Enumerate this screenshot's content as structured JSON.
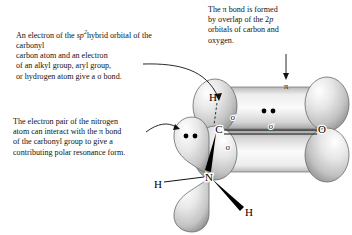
{
  "figure": {
    "title_semantic": "orbital-picture-of-amide-resonance",
    "background_color": "#ffffff"
  },
  "captions": {
    "sigma_bond": {
      "id": "sigma-bond-caption",
      "line1_pre": "An electron of the ",
      "line1_italic": "sp",
      "line1_sup": "2",
      "rest": "hybrid orbital of the carbonyl\ncarbon atom and an electron\nof an alkyl group, aryl group,\nor hydrogen atom give a σ bond."
    },
    "lone_pair": {
      "id": "lone-pair-caption",
      "text": "The electron pair of the nitrogen\natom can interact with the π bond\nof the carbonyl group to give a\ncontributing polar resonance form."
    },
    "pi_bond": {
      "id": "pi-bond-caption",
      "line1": "The π bond is formed",
      "line2_pre": "by overlap of the 2",
      "line2_italic": "p",
      "line3": "orbitals of carbon and",
      "line4": "oxygen."
    }
  },
  "atoms": [
    {
      "symbol": "C",
      "name": "carbonyl-carbon",
      "x": 219,
      "y": 129
    },
    {
      "symbol": "O",
      "name": "carbonyl-oxygen",
      "x": 322,
      "y": 129
    },
    {
      "symbol": "N",
      "name": "amide-nitrogen",
      "x": 209,
      "y": 177
    },
    {
      "symbol": "H",
      "name": "hydrogen-on-carbon",
      "x": 213,
      "y": 98
    },
    {
      "symbol": "H",
      "name": "hydrogen-on-nitrogen-left",
      "x": 158,
      "y": 185
    },
    {
      "symbol": "H",
      "name": "hydrogen-on-nitrogen-right",
      "x": 249,
      "y": 212
    }
  ],
  "bond_labels": [
    {
      "text": "σ",
      "name": "sigma-label-ch",
      "x": 233,
      "y": 117
    },
    {
      "text": "σ",
      "name": "sigma-label-cn",
      "x": 228,
      "y": 147
    },
    {
      "text": "σ",
      "name": "sigma-label-co",
      "x": 271,
      "y": 126
    },
    {
      "text": "π",
      "name": "pi-label",
      "x": 286,
      "y": 85
    }
  ],
  "colors": {
    "lobe_light": "#f2f2f2",
    "lobe_mid": "#c9c9c9",
    "lobe_dark": "#8d8d8d",
    "outline": "#555555",
    "text": "#111111"
  },
  "electron_pairs": [
    {
      "name": "carbonyl-pi-electrons",
      "cx": 268,
      "cy": 111
    },
    {
      "name": "nitrogen-lone-pair",
      "cx": 183,
      "cy": 136
    }
  ]
}
